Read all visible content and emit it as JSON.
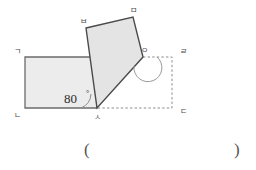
{
  "figure": {
    "colors": {
      "shape_fill": "#ececec",
      "shape_stroke": "#6b6b6b",
      "quad_stroke": "#4a4a4a",
      "dotted_stroke": "#8c8c8c",
      "label_color": "#4a4a4a",
      "angle_text_color": "#2b2b2b",
      "background": "#ffffff"
    },
    "rectangle": {
      "name": "rectangle-giniesa",
      "vertices": [
        {
          "label": "ㄱ",
          "x": 25,
          "y": 57
        },
        {
          "label": "ㄴ",
          "x": 25,
          "y": 108
        },
        {
          "label": "ㅅ",
          "x": 97,
          "y": 108
        }
      ],
      "points": "25,57 97,57 97,108 25,108"
    },
    "quadrilateral": {
      "name": "quadrilateral-sabmio",
      "vertices": [
        {
          "label": "ㅂ",
          "x": 86,
          "y": 28
        },
        {
          "label": "ㅁ",
          "x": 133,
          "y": 17
        },
        {
          "label": "ㅇ",
          "x": 143,
          "y": 57
        },
        {
          "label": "ㅅ",
          "x": 97,
          "y": 108
        }
      ],
      "points": "86,28 133,17 143,57 97,108"
    },
    "dotted_rectangle": {
      "name": "dotted-rectangle-girdas",
      "points": "97,57 172,57 172,108 97,108",
      "vertices": [
        {
          "label": "ㄹ",
          "x": 172,
          "y": 57
        },
        {
          "label": "ㄷ",
          "x": 172,
          "y": 108
        }
      ]
    },
    "labels": {
      "g": "ㄱ",
      "n": "ㄴ",
      "d": "ㄷ",
      "r": "ㄹ",
      "m": "ㅁ",
      "b": "ㅂ",
      "s": "ㅅ",
      "o": "ㅇ"
    },
    "angle_marks": [
      {
        "name": "angle-80-at-s",
        "value": "80",
        "unit": "°",
        "at_vertex": "ㅅ",
        "text_x": 68,
        "text_y": 102
      },
      {
        "name": "angle-arc-at-o",
        "at_vertex": "ㅇ",
        "value": "",
        "unit": ""
      }
    ]
  },
  "answer_blank": {
    "open_paren": "(",
    "close_paren": ")"
  }
}
